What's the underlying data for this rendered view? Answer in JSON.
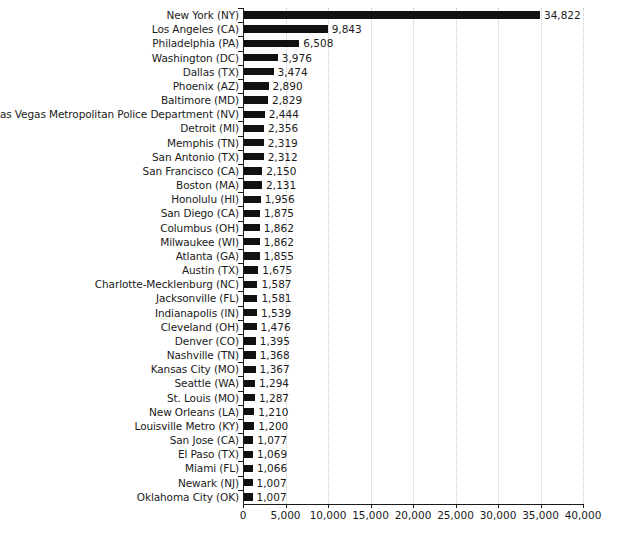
{
  "chart_data": {
    "type": "bar",
    "orientation": "horizontal",
    "title": "",
    "subtitle": "",
    "xlabel": "",
    "ylabel": "",
    "xlim": [
      0,
      40000
    ],
    "grid": true,
    "legend": null,
    "legend_position": "none",
    "bar_color": "#111111",
    "value_label_format": "comma-separated integer",
    "x_ticks": [
      0,
      5000,
      10000,
      15000,
      20000,
      25000,
      30000,
      35000,
      40000
    ],
    "x_tick_labels": [
      "0",
      "5,000",
      "10,000",
      "15,000",
      "20,000",
      "25,000",
      "30,000",
      "35,000",
      "40,000"
    ],
    "categories": [
      "New York (NY)",
      "Los Angeles (CA)",
      "Philadelphia (PA)",
      "Washington (DC)",
      "Dallas (TX)",
      "Phoenix (AZ)",
      "Baltimore (MD)",
      "Las Vegas Metropolitan Police Department (NV)",
      "Detroit (MI)",
      "Memphis (TN)",
      "San Antonio (TX)",
      "San Francisco (CA)",
      "Boston (MA)",
      "Honolulu (HI)",
      "San Diego (CA)",
      "Columbus (OH)",
      "Milwaukee (WI)",
      "Atlanta (GA)",
      "Austin (TX)",
      "Charlotte-Mecklenburg (NC)",
      "Jacksonville (FL)",
      "Indianapolis (IN)",
      "Cleveland (OH)",
      "Denver (CO)",
      "Nashville (TN)",
      "Kansas City (MO)",
      "Seattle (WA)",
      "St. Louis (MO)",
      "New Orleans (LA)",
      "Louisville Metro (KY)",
      "San Jose (CA)",
      "El Paso (TX)",
      "Miami (FL)",
      "Newark (NJ)",
      "Oklahoma City (OK)"
    ],
    "values": [
      34822,
      9843,
      6508,
      3976,
      3474,
      2890,
      2829,
      2444,
      2356,
      2319,
      2312,
      2150,
      2131,
      1956,
      1875,
      1862,
      1862,
      1855,
      1675,
      1587,
      1581,
      1539,
      1476,
      1395,
      1368,
      1367,
      1294,
      1287,
      1210,
      1200,
      1077,
      1069,
      1066,
      1007,
      1007
    ],
    "value_labels": [
      "34,822",
      "9,843",
      "6,508",
      "3,976",
      "3,474",
      "2,890",
      "2,829",
      "2,444",
      "2,356",
      "2,319",
      "2,312",
      "2,150",
      "2,131",
      "1,956",
      "1,875",
      "1,862",
      "1,862",
      "1,855",
      "1,675",
      "1,587",
      "1,581",
      "1,539",
      "1,476",
      "1,395",
      "1,368",
      "1,367",
      "1,294",
      "1,287",
      "1,210",
      "1,200",
      "1,077",
      "1,069",
      "1,066",
      "1,007",
      "1,007"
    ]
  }
}
